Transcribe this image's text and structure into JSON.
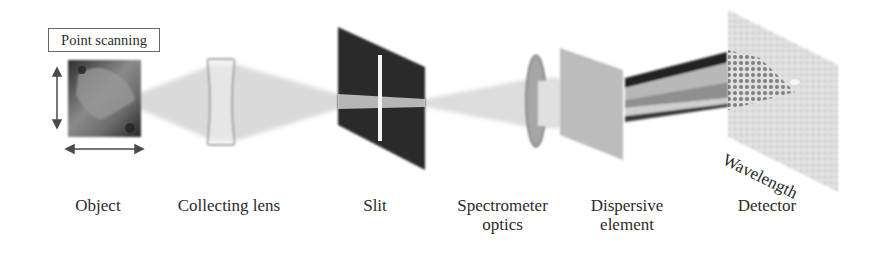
{
  "diagram": {
    "scan_mode_label": "Point scanning",
    "components": [
      {
        "id": "object",
        "label": "Object"
      },
      {
        "id": "collecting-lens",
        "label": "Collecting lens"
      },
      {
        "id": "slit",
        "label": "Slit"
      },
      {
        "id": "spectrometer-optics",
        "label_line1": "Spectrometer",
        "label_line2": "optics"
      },
      {
        "id": "dispersive-element",
        "label_line1": "Dispersive",
        "label_line2": "element"
      },
      {
        "id": "detector",
        "label": "Detector"
      }
    ],
    "axis_label": "Wavelength",
    "colors": {
      "beam": "#d9d9d9",
      "slit_panel": "#2a2a2a",
      "dispersive_panel": "#bdbdbd",
      "detector_panel": "#dcdcdc",
      "lens_outline": "#8a8a8a"
    }
  }
}
